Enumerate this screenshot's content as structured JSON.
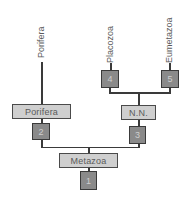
{
  "diagram": {
    "type": "cladogram",
    "leaf_labels": {
      "porifera": "Porifera",
      "placozoa": "Placozoa",
      "eumetazoa": "Eumetazoa"
    },
    "clade_boxes": {
      "porifera": "Porifera",
      "nn": "N.N.",
      "metazoa": "Metazoa"
    },
    "nodes": {
      "n1": "1",
      "n2": "2",
      "n3": "3",
      "n4": "4",
      "n5": "5"
    },
    "colors": {
      "line": "#3a3a3a",
      "clade_box_fill": "#cfcfcf",
      "node_box_fill": "#8a8a8a",
      "text": "#5a5a5a"
    }
  }
}
